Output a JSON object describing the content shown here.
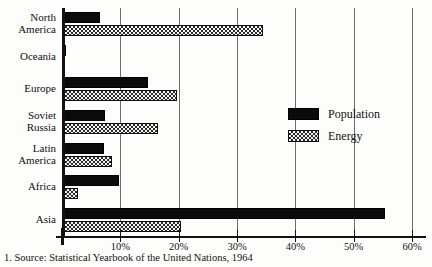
{
  "chart_data": {
    "type": "bar",
    "orientation": "horizontal",
    "title": "",
    "subtitle": "",
    "xlabel": "",
    "ylabel": "",
    "xlim": [
      0,
      60
    ],
    "xunit": "%",
    "grid": true,
    "grid_axis": "x",
    "legend_position": "right-middle",
    "categories": [
      "North America",
      "Oceania",
      "Europe",
      "Soviet Russia",
      "Latin America",
      "Africa",
      "Asia"
    ],
    "category_lines": [
      [
        "North",
        "America"
      ],
      [
        "Oceania"
      ],
      [
        "Europe"
      ],
      [
        "Soviet",
        "Russia"
      ],
      [
        "Latin",
        "America"
      ],
      [
        "Africa"
      ],
      [
        "Asia"
      ]
    ],
    "series": [
      {
        "name": "Population",
        "pattern": "solid-black",
        "color": "#0b0b0b",
        "values": [
          6.5,
          0.6,
          14.7,
          7.4,
          7.2,
          9.8,
          55.4
        ]
      },
      {
        "name": "Energy",
        "pattern": "checkered-hatch",
        "color": "#2a2a2a",
        "values": [
          34.4,
          0.5,
          19.7,
          16.5,
          8.6,
          2.7,
          20.4
        ]
      }
    ],
    "xticks": [
      0,
      10,
      20,
      30,
      40,
      50,
      60
    ],
    "xticklabels": [
      "",
      "10%",
      "20%",
      "30%",
      "40%",
      "50%",
      "60%"
    ]
  },
  "legend": {
    "items": [
      {
        "label": "Population",
        "swatch": "solid"
      },
      {
        "label": "Energy",
        "swatch": "hatch"
      }
    ]
  },
  "caption": {
    "text": "1. Source: Statistical Yearbook of the United Nations, 1964"
  }
}
